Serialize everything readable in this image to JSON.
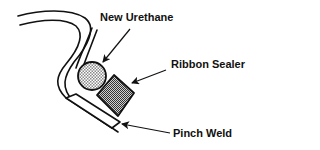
{
  "diagram": {
    "labels": {
      "new_urethane": "New Urethane",
      "ribbon_sealer": "Ribbon Sealer",
      "pinch_weld": "Pinch Weld"
    },
    "colors": {
      "stroke": "#111111",
      "background": "#ffffff",
      "urethane_fill": "#cfcfcf",
      "sealer_fill": "#9a9a9a"
    }
  }
}
